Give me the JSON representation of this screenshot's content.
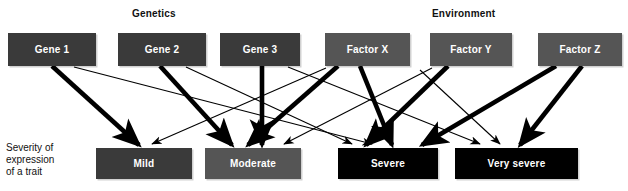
{
  "figure": {
    "type": "influence-diagram",
    "headers": [
      {
        "id": "genetics",
        "label": "Genetics",
        "x": 132,
        "y": 8
      },
      {
        "id": "environment",
        "label": "Environment",
        "x": 432,
        "y": 8
      }
    ],
    "side_label": {
      "id": "severity-label",
      "lines": [
        "Severity of",
        "expression",
        "of a trait"
      ],
      "x": 6,
      "y": 142
    },
    "colors": {
      "gene_box": "#3a3a3a",
      "factor_box": "#555555",
      "mild_box": "#3a3a3a",
      "moderate_box": "#555555",
      "severe_box": "#000000",
      "very_severe_box": "#000000",
      "edge": "#000000",
      "text_on_box": "#ffffff",
      "page_text": "#111111",
      "background": "#ffffff"
    },
    "causes": [
      {
        "id": "gene-1",
        "label": "Gene 1",
        "group": "genetics",
        "x": 8,
        "y": 33,
        "w": 88,
        "h": 33,
        "fill": "#3a3a3a"
      },
      {
        "id": "gene-2",
        "label": "Gene 2",
        "group": "genetics",
        "x": 118,
        "y": 33,
        "w": 88,
        "h": 33,
        "fill": "#3a3a3a"
      },
      {
        "id": "gene-3",
        "label": "Gene 3",
        "group": "genetics",
        "x": 220,
        "y": 33,
        "w": 80,
        "h": 33,
        "fill": "#3a3a3a"
      },
      {
        "id": "factor-x",
        "label": "Factor X",
        "group": "environment",
        "x": 325,
        "y": 33,
        "w": 85,
        "h": 33,
        "fill": "#555555"
      },
      {
        "id": "factor-y",
        "label": "Factor Y",
        "group": "environment",
        "x": 430,
        "y": 33,
        "w": 82,
        "h": 33,
        "fill": "#555555"
      },
      {
        "id": "factor-z",
        "label": "Factor Z",
        "group": "environment",
        "x": 538,
        "y": 33,
        "w": 84,
        "h": 33,
        "fill": "#555555"
      }
    ],
    "outcomes": [
      {
        "id": "mild",
        "label": "Mild",
        "x": 96,
        "y": 148,
        "w": 96,
        "h": 31,
        "fill": "#3a3a3a"
      },
      {
        "id": "moderate",
        "label": "Moderate",
        "x": 205,
        "y": 148,
        "w": 96,
        "h": 31,
        "fill": "#555555"
      },
      {
        "id": "severe",
        "label": "Severe",
        "x": 338,
        "y": 148,
        "w": 100,
        "h": 31,
        "fill": "#000000"
      },
      {
        "id": "very-severe",
        "label": "Very severe",
        "x": 455,
        "y": 148,
        "w": 123,
        "h": 31,
        "fill": "#000000"
      }
    ],
    "edges": [
      {
        "id": "gene1-to-mild",
        "from": "gene-1",
        "to": "mild",
        "weight": "strong",
        "x1": 52,
        "y1": 66,
        "x2": 139,
        "y2": 145
      },
      {
        "id": "gene1-to-severe",
        "from": "gene-1",
        "to": "severe",
        "weight": "weak",
        "x1": 74,
        "y1": 67,
        "x2": 372,
        "y2": 144
      },
      {
        "id": "gene2-to-moderate",
        "from": "gene-2",
        "to": "moderate",
        "weight": "strong",
        "x1": 160,
        "y1": 66,
        "x2": 232,
        "y2": 145
      },
      {
        "id": "gene2-to-severe",
        "from": "gene-2",
        "to": "severe",
        "weight": "weak",
        "x1": 186,
        "y1": 67,
        "x2": 352,
        "y2": 144
      },
      {
        "id": "gene3-to-moderate",
        "from": "gene-3",
        "to": "moderate",
        "weight": "strong",
        "x1": 262,
        "y1": 66,
        "x2": 262,
        "y2": 145
      },
      {
        "id": "gene3-to-severe",
        "from": "gene-3",
        "to": "severe",
        "weight": "weak",
        "x1": 288,
        "y1": 67,
        "x2": 480,
        "y2": 144
      },
      {
        "id": "factorx-to-moderate",
        "from": "factor-x",
        "to": "moderate",
        "weight": "strong",
        "x1": 338,
        "y1": 66,
        "x2": 248,
        "y2": 145
      },
      {
        "id": "factorx-to-severe",
        "from": "factor-x",
        "to": "severe",
        "weight": "strong",
        "x1": 360,
        "y1": 66,
        "x2": 392,
        "y2": 145
      },
      {
        "id": "factorx-to-mild",
        "from": "factor-x",
        "to": "mild",
        "weight": "weak",
        "x1": 326,
        "y1": 68,
        "x2": 152,
        "y2": 144
      },
      {
        "id": "factory-to-severe",
        "from": "factor-y",
        "to": "severe",
        "weight": "strong",
        "x1": 448,
        "y1": 66,
        "x2": 366,
        "y2": 145
      },
      {
        "id": "factory-to-moderate",
        "from": "factor-y",
        "to": "moderate",
        "weight": "weak",
        "x1": 432,
        "y1": 68,
        "x2": 284,
        "y2": 144
      },
      {
        "id": "factorz-to-severe",
        "from": "factor-z",
        "to": "severe",
        "weight": "strong",
        "x1": 556,
        "y1": 66,
        "x2": 422,
        "y2": 145
      },
      {
        "id": "factorz-to-verysevere",
        "from": "factor-z",
        "to": "very-severe",
        "weight": "strong",
        "x1": 582,
        "y1": 66,
        "x2": 520,
        "y2": 145
      },
      {
        "id": "factorz-to-verysevere-2",
        "from": "factor-z",
        "to": "very-severe",
        "weight": "weak",
        "x1": 420,
        "y1": 70,
        "x2": 500,
        "y2": 144
      }
    ]
  }
}
